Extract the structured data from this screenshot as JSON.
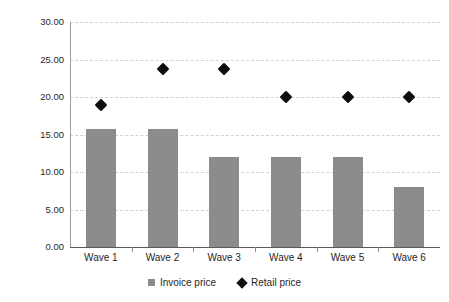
{
  "chart_data": {
    "type": "bar",
    "title": "",
    "subtitle": "",
    "xlabel": "",
    "ylabel": "Price (€)",
    "categories": [
      "Wave 1",
      "Wave 2",
      "Wave 3",
      "Wave 4",
      "Wave 5",
      "Wave 6"
    ],
    "ylim": [
      0,
      30
    ],
    "ytick_step": 5,
    "ytick_labels": [
      "30.00",
      "25.00",
      "20.00",
      "15.00",
      "10.00",
      "5.00",
      "0.00"
    ],
    "ytick_values": [
      30,
      25,
      20,
      15,
      10,
      5,
      0
    ],
    "grid": true,
    "grid_axis": "y",
    "legend_position": "bottom",
    "series": [
      {
        "name": "Invoice price",
        "type": "bar",
        "marker": "square",
        "color": "#8c8c8c",
        "values": [
          15.8,
          15.8,
          12.0,
          12.0,
          12.0,
          8.0
        ]
      },
      {
        "name": "Retail price",
        "type": "scatter",
        "marker": "diamond",
        "color": "#0d0d0d",
        "values": [
          19.0,
          23.8,
          23.8,
          20.0,
          20.0,
          20.0
        ]
      }
    ]
  },
  "legend": {
    "items": [
      {
        "label": "Invoice price",
        "marker": "square-marker",
        "color": "#8c8c8c"
      },
      {
        "label": "Retail price",
        "marker": "diamond-marker",
        "color": "#0d0d0d"
      }
    ]
  }
}
